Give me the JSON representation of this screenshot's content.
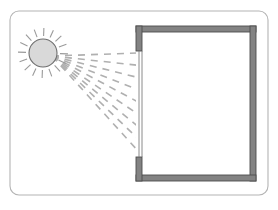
{
  "figure": {
    "background_color": "#ffffff"
  },
  "frame": {
    "name": "diagram-border",
    "shape": "rounded-rectangle",
    "x": 10,
    "y": 11,
    "width": 258,
    "height": 184,
    "corner_radius": 9,
    "stroke_color": "#b4b4b4",
    "stroke_width": 1.1,
    "fill_color": "#ffffff"
  },
  "sun": {
    "name": "sun",
    "center_x": 43,
    "center_y": 53,
    "radius": 14,
    "fill_color": "#d9d9d9",
    "stroke_color": "#6e6e6e",
    "stroke_width": 1.1,
    "ray_count": 16,
    "ray_inner_radius": 17,
    "ray_outer_radius": 25,
    "ray_color": "#9a9a9a",
    "ray_width": 1.1
  },
  "room": {
    "name": "room",
    "wall_color": "#838383",
    "wall_stroke_color": "#4d4d4d",
    "wall_stroke_width": 0.9,
    "interior_fill": "#ffffff",
    "outer": {
      "x": 136,
      "y": 26,
      "width": 120,
      "height": 155
    },
    "wall_thickness": 6,
    "opening": {
      "name": "window-opening",
      "side": "left",
      "top_y": 51,
      "bottom_y": 157,
      "glass_color": "#7d7d7d",
      "glass_stroke_width": 0.9,
      "glass_pane_x1": 139,
      "glass_pane_x2": 142
    }
  },
  "rays": {
    "name": "sunlight-rays",
    "color": "#b0b0b0",
    "width": 1.6,
    "dash_pattern": "7 6",
    "exterior": {
      "origin_x": 52,
      "origin_y": 56,
      "count": 9,
      "target_x": 139,
      "target_top_y": 53,
      "target_bottom_y": 152
    },
    "interior": {
      "count": 9,
      "origin_x": 142,
      "source_top_y": 53,
      "source_bottom_y": 152,
      "end_x": 252,
      "end_top_y": 55,
      "end_bottom_y": 176
    }
  },
  "legend": {
    "visible": false,
    "items": []
  },
  "labels": {
    "visible": false,
    "items": []
  },
  "chart_data": {
    "type": "diagram",
    "title": "",
    "elements": [
      {
        "id": "sun",
        "label": "",
        "kind": "light-source"
      },
      {
        "id": "rays-exterior",
        "label": "",
        "kind": "dashed-rays",
        "count": 9
      },
      {
        "id": "window",
        "label": "",
        "kind": "glazing"
      },
      {
        "id": "room-walls",
        "label": "",
        "kind": "enclosure"
      },
      {
        "id": "rays-interior",
        "label": "",
        "kind": "dashed-rays",
        "count": 9
      }
    ]
  }
}
